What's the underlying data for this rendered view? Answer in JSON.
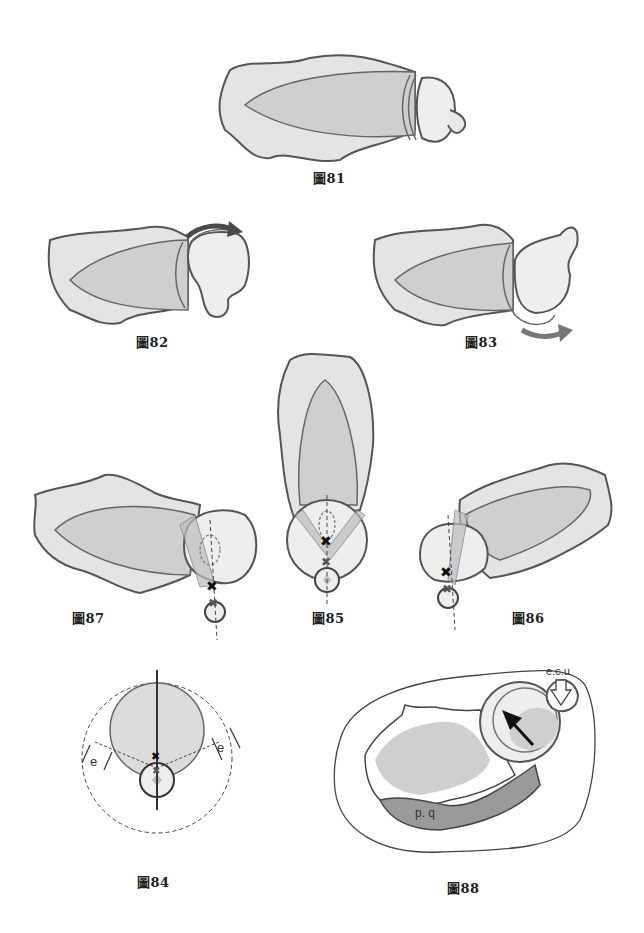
{
  "figures": {
    "fig81": {
      "caption": "圖81",
      "description": "radius-ulna wrist view, neutral"
    },
    "fig82": {
      "caption": "圖82",
      "arrow": "clockwise-over-top"
    },
    "fig83": {
      "caption": "圖83",
      "arrow": "rotation-underneath"
    },
    "fig84": {
      "caption": "圖84",
      "labels": [
        "e",
        "e"
      ]
    },
    "fig85": {
      "caption": "圖85"
    },
    "fig86": {
      "caption": "圖86"
    },
    "fig87": {
      "caption": "圖87"
    },
    "fig88": {
      "caption": "圖88",
      "labels": {
        "tendon": "e.c.u",
        "muscle": "p. q"
      }
    }
  },
  "colors": {
    "outline": "#555555",
    "bone_fill": "#e4e4e4",
    "inner_fill": "#cfcfcf",
    "arrow_dark": "#4a4a4a",
    "background": "#ffffff"
  }
}
